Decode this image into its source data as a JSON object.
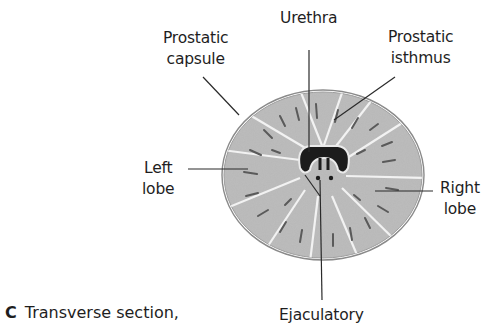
{
  "figure": {
    "panel_letter": "C",
    "caption": "Transverse section,",
    "labels": {
      "urethra": "Urethra",
      "prostatic_capsule": [
        "Prostatic",
        "capsule"
      ],
      "prostatic_isthmus": [
        "Prostatic",
        "isthmus"
      ],
      "left_lobe": [
        "Left",
        "lobe"
      ],
      "right_lobe": [
        "Right",
        "lobe"
      ],
      "ejaculatory": "Ejaculatory"
    },
    "colors": {
      "tissue_fill": "#b9b9b9",
      "capsule_stroke": "#8a8a8a",
      "urethra_lumen": "#1c1c1c",
      "leader_line": "#2a2a2a"
    }
  }
}
